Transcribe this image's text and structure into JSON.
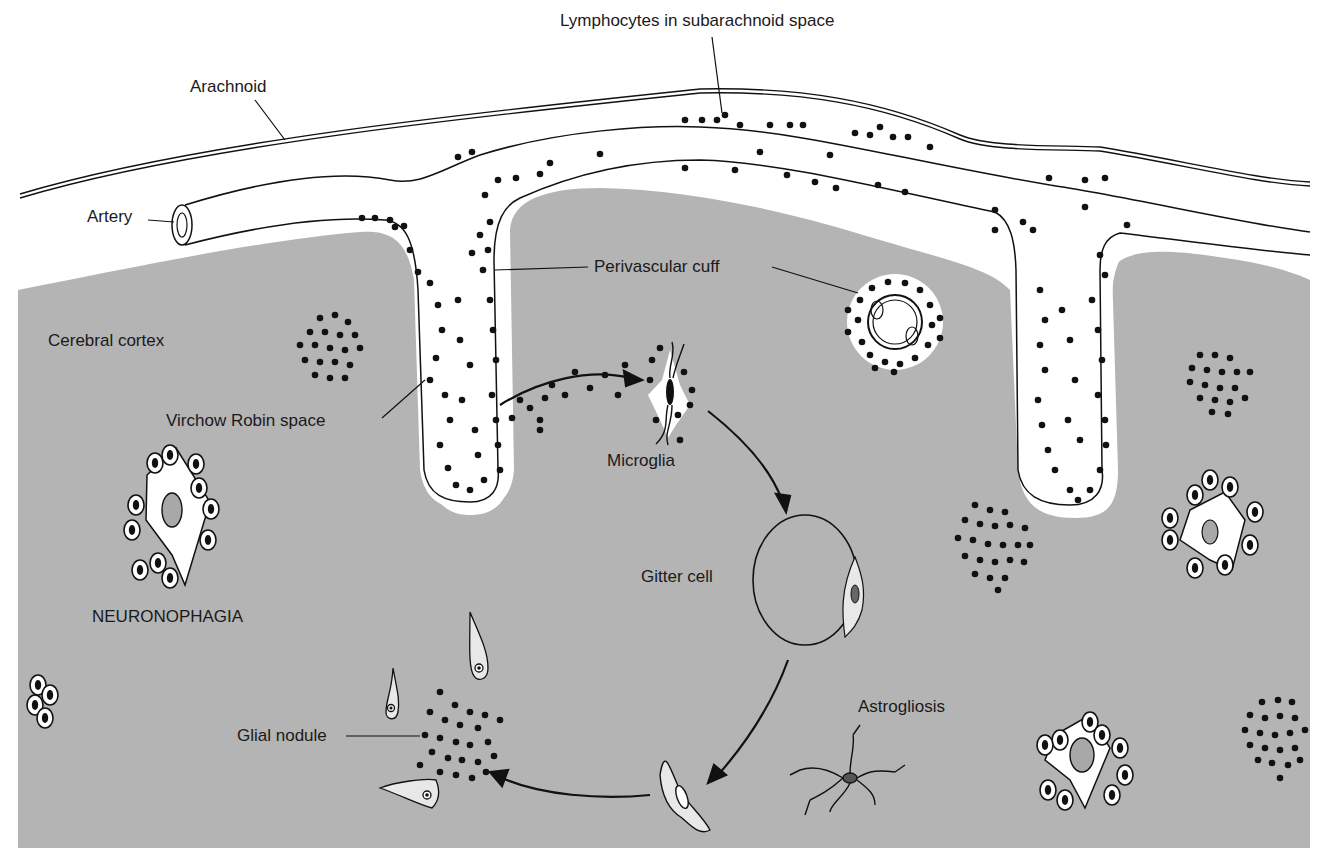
{
  "diagram": {
    "type": "anatomical illustration",
    "colors": {
      "cortex": "#b4b4b4",
      "ink": "#111111",
      "space": "#ffffff",
      "nucleus_gray": "#a8a8a8"
    },
    "labels": {
      "lymphocytes": "Lymphocytes in subarachnoid space",
      "arachnoid": "Arachnoid",
      "artery": "Artery",
      "perivascular_cuff": "Perivascular cuff",
      "cerebral_cortex": "Cerebral cortex",
      "virchow_robin": "Virchow Robin space",
      "microglia": "Microglia",
      "gitter_cell": "Gitter cell",
      "neuronophagia": "NEURONOPHAGIA",
      "glial_nodule": "Glial nodule",
      "astrogliosis": "Astrogliosis"
    },
    "relationships": [
      {
        "from": "virchow_robin",
        "to": "microglia",
        "type": "arrow"
      },
      {
        "from": "microglia",
        "to": "gitter_cell",
        "type": "arrow"
      },
      {
        "from": "gitter_cell",
        "to": "elongated_cell",
        "type": "arrow"
      },
      {
        "from": "elongated_cell",
        "to": "glial_nodule",
        "type": "arrow"
      }
    ]
  }
}
